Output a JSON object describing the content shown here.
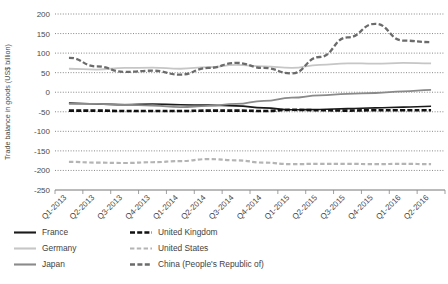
{
  "chart_data": {
    "type": "line",
    "title": "",
    "xlabel": "",
    "ylabel": "Trade balance in goods (US$ billion)",
    "ylim": [
      -250,
      200
    ],
    "yticks": [
      200,
      150,
      100,
      50,
      0,
      -50,
      -100,
      -150,
      -200,
      -250
    ],
    "ytick_labels": [
      "200",
      "150",
      "100",
      "50",
      "0",
      "-50",
      "-100",
      "-150",
      "-200",
      "-250"
    ],
    "grid": true,
    "grid_style": "dotted-horizontal",
    "legend_position": "below-left",
    "legend_columns": 2,
    "categories": [
      "Q1-2013",
      "Q2-2013",
      "Q3-2013",
      "Q4-2013",
      "Q1-2014",
      "Q2-2014",
      "Q3-2014",
      "Q4-2014",
      "Q1-2015",
      "Q2-2015",
      "Q3-2015",
      "Q4-2015",
      "Q1-2016",
      "Q2-2016"
    ],
    "series": [
      {
        "name": "France",
        "style": "solid",
        "color": "#1a1a1a",
        "width": 1.6,
        "values": [
          -28,
          -30,
          -32,
          -30,
          -32,
          -33,
          -35,
          -40,
          -45,
          -44,
          -42,
          -40,
          -38,
          -36
        ]
      },
      {
        "name": "Germany",
        "style": "solid",
        "color": "#c6c6c6",
        "width": 1.8,
        "values": [
          60,
          58,
          62,
          63,
          60,
          64,
          70,
          66,
          62,
          70,
          74,
          73,
          75,
          74
        ]
      },
      {
        "name": "Japan",
        "style": "solid",
        "color": "#8a8a8a",
        "width": 1.8,
        "values": [
          -30,
          -30,
          -32,
          -34,
          -38,
          -35,
          -30,
          -22,
          -14,
          -8,
          -4,
          -2,
          2,
          6
        ]
      },
      {
        "name": "United Kingdom",
        "style": "dashed-bold",
        "color": "#111111",
        "width": 2.6,
        "values": [
          -47,
          -47,
          -48,
          -48,
          -48,
          -47,
          -47,
          -48,
          -45,
          -46,
          -47,
          -46,
          -46,
          -46
        ]
      },
      {
        "name": "United States",
        "style": "dashed-light",
        "color": "#b4b4b4",
        "width": 2.2,
        "values": [
          -178,
          -180,
          -181,
          -179,
          -176,
          -171,
          -174,
          -180,
          -184,
          -183,
          -183,
          -184,
          -183,
          -184
        ]
      },
      {
        "name": "China (People's Republic of)",
        "style": "dashed-medium",
        "color": "#6b6b6b",
        "width": 2.3,
        "values": [
          88,
          66,
          52,
          55,
          45,
          62,
          75,
          62,
          48,
          90,
          140,
          175,
          132,
          128
        ]
      }
    ],
    "secondary_segments": {
      "note": "China peaks near 175 in Q4-2015 and again near 175 in Q1-2016"
    }
  },
  "legend": {
    "items": [
      {
        "label": "France",
        "key": "france",
        "swatch": "solid-black"
      },
      {
        "label": "United Kingdom",
        "key": "united-kingdom",
        "swatch": "dashed-bold-black"
      },
      {
        "label": "Germany",
        "key": "germany",
        "swatch": "solid-light-gray"
      },
      {
        "label": "United States",
        "key": "united-states",
        "swatch": "dashed-light-gray"
      },
      {
        "label": "Japan",
        "key": "japan",
        "swatch": "solid-gray"
      },
      {
        "label": "China (People's Republic of)",
        "key": "china",
        "swatch": "dashed-gray"
      }
    ]
  }
}
